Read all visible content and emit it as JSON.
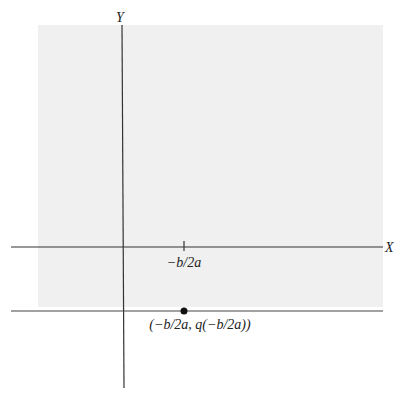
{
  "figure": {
    "type": "coordinate-plane-diagram",
    "colors": {
      "background": "#ffffff",
      "shaded_region": "#f0f0f0",
      "axis": "#333333",
      "point": "#111111",
      "text": "#222222"
    },
    "axes": {
      "x_label": "X",
      "y_label": "Y"
    },
    "shaded_region": {
      "description": "upper half-plane y >= q(-b/2a)",
      "bounds_px": {
        "left": 38,
        "top": 25,
        "right": 383,
        "bottom": 307
      }
    },
    "tick": {
      "label": "−b/2a",
      "x_px": 184
    },
    "horizontal_line": {
      "description": "line y = q(-b/2a)",
      "y_px": 311
    },
    "point": {
      "label": "(−b/2a, q(−b/2a))",
      "x_px": 184,
      "y_px": 311
    }
  }
}
